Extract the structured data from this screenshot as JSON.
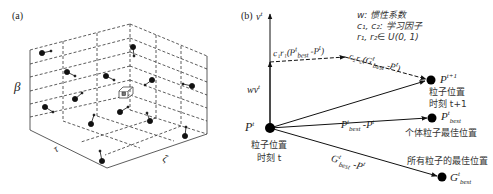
{
  "panel_a": {
    "label": "(a)",
    "axis_vertical": "β",
    "axis_left": "τ",
    "axis_right": "ζ"
  },
  "panel_b": {
    "label": "(b)",
    "velocity": {
      "base": "v",
      "sup": "t"
    },
    "inertia": {
      "base": "wv",
      "sup": "t"
    },
    "legend": {
      "line1": "w: 惯性系数",
      "line2": "c₁, c₂: 学习因子",
      "line3": "r₁, r₂∈ U(0, 1)"
    },
    "cognitive_term": {
      "prefix": "c₁r₁(P",
      "sub": "best",
      "sup": "t",
      "suffix": " -P",
      "sup2": "t",
      "close": ")"
    },
    "social_term": {
      "prefix": "c₂r₂(G",
      "sub": "best",
      "sup": "t",
      "suffix": " -P",
      "sup2": "t",
      "close": ")"
    },
    "current_position": {
      "base": "P",
      "sup": "t",
      "caption1": "粒子位置",
      "caption2": "时刻 t"
    },
    "next_position": {
      "base": "P",
      "sup": "t+1",
      "caption1": "粒子位置",
      "caption2": "时刻 t+1"
    },
    "pbest": {
      "base": "P",
      "sub": "best",
      "sup": "t",
      "caption": "个体粒子最佳位置"
    },
    "gbest": {
      "base": "G",
      "sub": "best",
      "sup": "t",
      "caption": "所有粒子的最佳位置"
    },
    "pbest_diff": {
      "base": "P",
      "sub": "best",
      "sup": "t",
      "suffix": " -P",
      "sup2": "t"
    },
    "gbest_diff": {
      "base": "G",
      "sub": "best",
      "sup": "t",
      "suffix": " -P",
      "sup2": "t"
    }
  }
}
